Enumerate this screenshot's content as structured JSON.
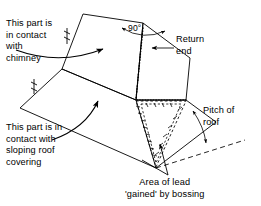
{
  "figure": {
    "background_color": "#ffffff",
    "line_color": "#000000",
    "text_color": "#000000"
  },
  "annotations": {
    "chimney_contact": "This part is\nin contact\nwith\nchimney",
    "return_end": "Return\nend",
    "sloping_roof_contact": "This part is in\ncontact with\nsloping roof\ncovering",
    "pitch_of_roof": "Pitch of\nroof",
    "area_gained": "Area of lead\n'gained' by bossing",
    "angle_90": "90°"
  },
  "icon_names": {
    "curved_arrow_chimney": "curved-arrow-icon",
    "curved_arrow_roof": "curved-arrow-icon",
    "leader_return_end": "leader-arrow-icon",
    "angle_arc": "angle-arc-icon",
    "pitch_arc": "double-arrow-arc-icon",
    "bossing_arrow": "leader-arrow-icon"
  },
  "geometry": {
    "note": "Isometric projection of a lead bossing piece: upright chimney face folded at 90 degrees, flat sloping roof apron, and a dashed triangular wedge showing material gained by bossing.",
    "vertices": {
      "center": [
        136,
        100
      ],
      "left_fold": [
        62,
        69
      ],
      "apex_90": [
        143,
        23
      ],
      "top_left": [
        83,
        14
      ],
      "top_right": [
        190,
        58
      ],
      "bottom_apex": [
        156,
        168
      ]
    },
    "dashed_wedge_label": "Area of lead 'gained' by bossing",
    "dotted_fold_line": true
  }
}
